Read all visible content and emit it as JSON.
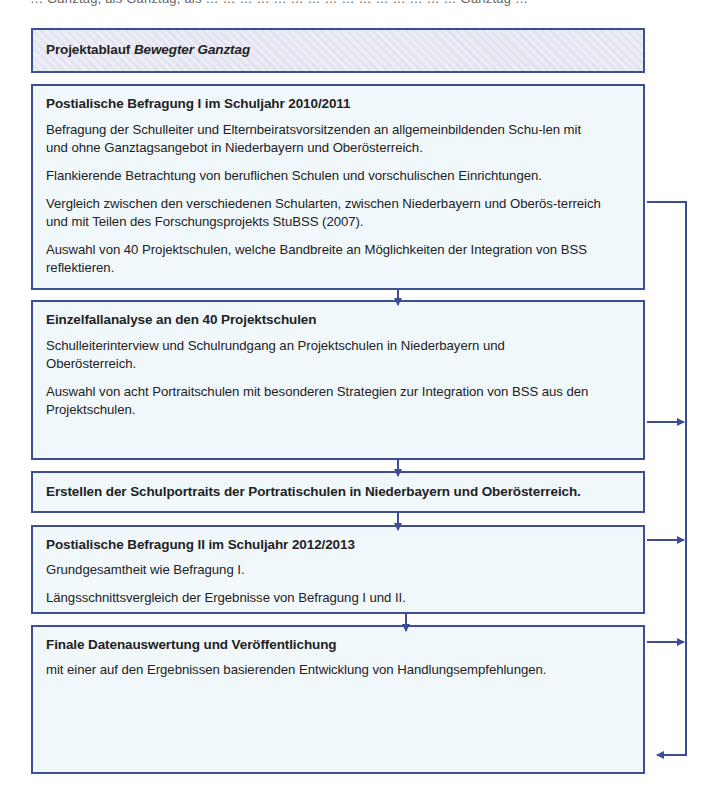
{
  "cut_off_text": "… Ganztag, als Ganztag, als … … … … … … … … … … … … … … … Ganztag …",
  "header": {
    "title_plain": "Projektablauf ",
    "title_italic": "Bewegter Ganztag"
  },
  "steps": [
    {
      "title": "Postialische Befragung I im Schuljahr 2010/2011",
      "paragraphs": [
        "Befragung der Schulleiter und Elternbeiratsvorsitzenden an allgemeinbildenden Schu-len mit und ohne Ganztagsangebot in Niederbayern und Oberösterreich.",
        "Flankierende Betrachtung von beruflichen Schulen und vorschulischen Einrichtungen.",
        "Vergleich zwischen den verschiedenen Schularten, zwischen Niederbayern und Oberös-terreich und mit Teilen des Forschungsprojekts StuBSS (2007).",
        "Auswahl von 40 Projektschulen, welche Bandbreite an Möglichkeiten der Integration von BSS reflektieren."
      ]
    },
    {
      "title": "Einzelfallanalyse an den 40 Projektschulen",
      "paragraphs": [
        "Schulleiterinterview und Schulrundgang an Projektschulen in Niederbayern und Oberösterreich.",
        "Auswahl von acht Portraitschulen mit besonderen Strategien zur Integration von BSS aus den Projektschulen."
      ]
    },
    {
      "title": "Erstellen der Schulportraits der Portratischulen in Niederbayern und Oberösterreich.",
      "paragraphs": []
    },
    {
      "title": "Postialische Befragung II im Schuljahr 2012/2013",
      "paragraphs": [
        "Grundgesamtheit wie Befragung I.",
        "Längsschnittsvergleich der Ergebnisse von Befragung I und II."
      ]
    },
    {
      "title": "Finale Datenauswertung und Veröffentlichung",
      "paragraphs": [
        "mit einer auf den Ergebnissen basierenden Entwicklung von Handlungsempfehlungen."
      ]
    }
  ],
  "colors": {
    "border": "#3d4e92",
    "box_fill": "#f1f8fc",
    "header_fill": "#e2e4f0",
    "arrow": "#3a4d96"
  }
}
